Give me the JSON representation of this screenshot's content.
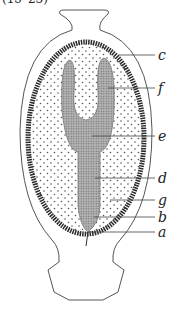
{
  "caption": "(15–23)",
  "labels": [
    {
      "letter": "c",
      "y": 55
    },
    {
      "letter": "f",
      "y": 88
    },
    {
      "letter": "e",
      "y": 136
    },
    {
      "letter": "d",
      "y": 178
    },
    {
      "letter": "g",
      "y": 200
    },
    {
      "letter": "b",
      "y": 217
    },
    {
      "letter": "a",
      "y": 232
    }
  ],
  "colors": {
    "line": "#444444",
    "ring": "#2a2a2a",
    "fill_dots": "#555555",
    "tissue": "#9a9a9a"
  }
}
